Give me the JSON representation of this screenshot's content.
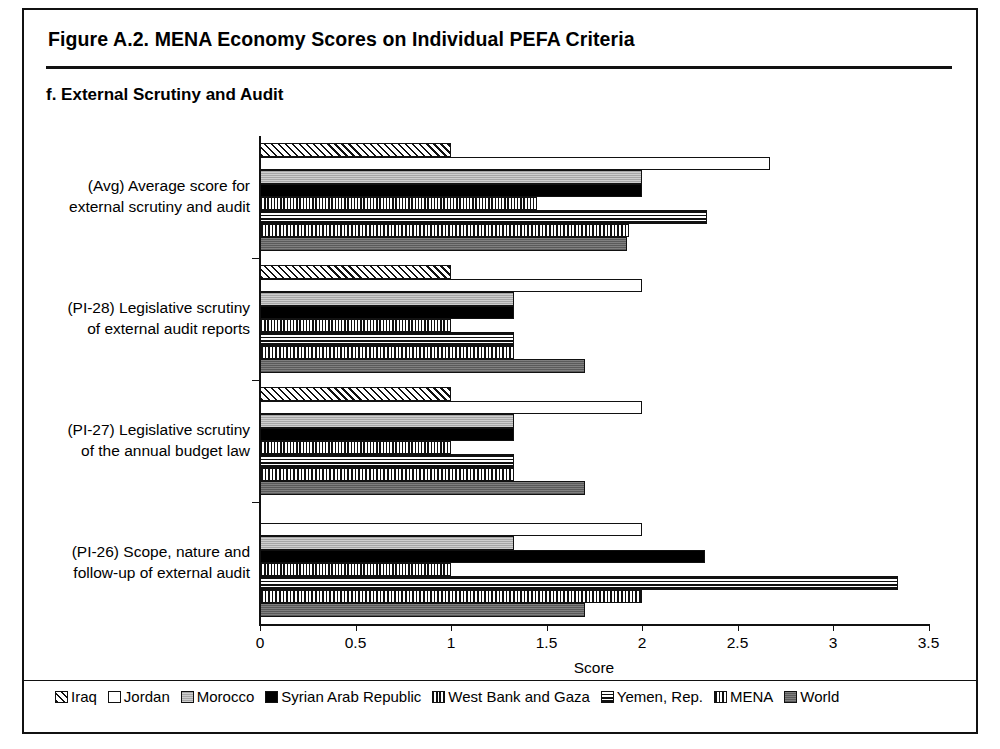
{
  "figure": {
    "title": "Figure A.2. MENA Economy Scores on Individual PEFA Criteria",
    "panel_title": "f. External Scrutiny and Audit"
  },
  "axis": {
    "xlabel": "Score",
    "ticks": [
      "0",
      "0.5",
      "1",
      "1.5",
      "2",
      "2.5",
      "3",
      "3.5"
    ]
  },
  "legend": {
    "items": [
      {
        "label": "Iraq",
        "pattern": "p-iraq"
      },
      {
        "label": "Jordan",
        "pattern": "p-jordan"
      },
      {
        "label": "Morocco",
        "pattern": "p-morocco"
      },
      {
        "label": "Syrian Arab Republic",
        "pattern": "p-syria"
      },
      {
        "label": "West Bank and Gaza",
        "pattern": "p-wbg"
      },
      {
        "label": "Yemen, Rep.",
        "pattern": "p-yemen"
      },
      {
        "label": "MENA",
        "pattern": "p-mena"
      },
      {
        "label": "World",
        "pattern": "p-world"
      }
    ]
  },
  "categories_display": [
    {
      "line1": "(Avg) Average score for",
      "line2": "external scrutiny and audit"
    },
    {
      "line1": "(PI-28) Legislative scrutiny",
      "line2": "of external audit reports"
    },
    {
      "line1": "(PI-27) Legislative scrutiny",
      "line2": "of the annual budget law"
    },
    {
      "line1": "(PI-26) Scope, nature and",
      "line2": "follow-up of external audit"
    }
  ],
  "chart_data": {
    "type": "bar",
    "orientation": "horizontal",
    "title": "f. External Scrutiny and Audit",
    "xlabel": "Score",
    "ylabel": "",
    "xlim": [
      0,
      3.5
    ],
    "xticks": [
      0,
      0.5,
      1,
      1.5,
      2,
      2.5,
      3,
      3.5
    ],
    "grid": false,
    "legend_position": "bottom",
    "categories": [
      "(PI-26) Scope, nature and follow-up of external audit",
      "(PI-27) Legislative scrutiny of the annual budget law",
      "(PI-28) Legislative scrutiny of external audit reports",
      "(Avg) Average score for external scrutiny and audit"
    ],
    "series": [
      {
        "name": "Iraq",
        "values": [
          0,
          1.0,
          1.0,
          1.0
        ]
      },
      {
        "name": "Jordan",
        "values": [
          2.0,
          2.0,
          2.0,
          2.67
        ]
      },
      {
        "name": "Morocco",
        "values": [
          1.33,
          1.33,
          1.33,
          2.0
        ]
      },
      {
        "name": "Syrian Arab Republic",
        "values": [
          2.33,
          1.33,
          1.33,
          2.0
        ]
      },
      {
        "name": "West Bank and Gaza",
        "values": [
          1.0,
          1.0,
          1.0,
          1.45
        ]
      },
      {
        "name": "Yemen, Rep.",
        "values": [
          3.34,
          1.33,
          1.33,
          2.34
        ]
      },
      {
        "name": "MENA",
        "values": [
          2.0,
          1.33,
          1.33,
          1.93
        ]
      },
      {
        "name": "World",
        "values": [
          1.7,
          1.7,
          1.7,
          1.92
        ]
      }
    ]
  }
}
